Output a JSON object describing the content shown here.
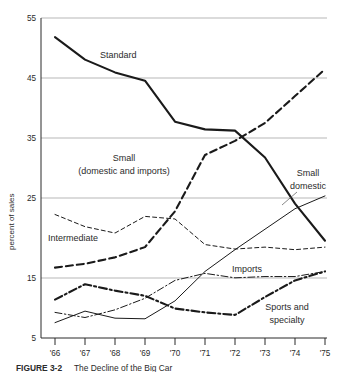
{
  "figure": {
    "caption_label": "FIGURE 3-2",
    "caption_text": "The Decline of the Big Car"
  },
  "chart_data": {
    "type": "line",
    "title": "",
    "xlabel": "",
    "ylabel": "percent of sales",
    "x": [
      "'66",
      "'67",
      "'68",
      "'69",
      "'70",
      "'71",
      "'72",
      "'73",
      "'74",
      "'75"
    ],
    "xlim": [
      0,
      9
    ],
    "ylim": [
      5,
      55
    ],
    "yticks": [
      55,
      45,
      35,
      25,
      15,
      5
    ],
    "gridlines": [
      55,
      45,
      35,
      25,
      15
    ],
    "grid": true,
    "legend": "inline-annotations",
    "series": [
      {
        "name": "Standard",
        "label": "Standard",
        "style": "solid-thick",
        "values": [
          52.0,
          48.5,
          46.5,
          45.2,
          38.8,
          37.6,
          37.4,
          33.2,
          26.0,
          20.2
        ]
      },
      {
        "name": "Small (domestic and imports)",
        "label": "Small\n(domestic and imports)",
        "style": "dashed-thick",
        "values": [
          16.0,
          16.6,
          17.6,
          19.2,
          24.8,
          33.6,
          35.8,
          38.6,
          42.8,
          47.0
        ]
      },
      {
        "name": "Intermediate",
        "label": "Intermediate",
        "style": "dashed-thin",
        "values": [
          24.3,
          22.4,
          21.4,
          24.0,
          23.6,
          19.6,
          18.9,
          19.2,
          18.8,
          19.2
        ]
      },
      {
        "name": "Small domestic",
        "label": "Small\ndomestic",
        "style": "solid-thin",
        "values": [
          7.4,
          9.2,
          8.1,
          8.0,
          10.8,
          15.4,
          18.8,
          22.0,
          25.2,
          27.2
        ]
      },
      {
        "name": "Imports",
        "label": "Imports",
        "style": "dashdot-thin",
        "values": [
          9.0,
          8.2,
          9.4,
          11.2,
          14.0,
          15.1,
          14.4,
          14.6,
          14.6,
          15.4
        ]
      },
      {
        "name": "Sports and specialty",
        "label": "Sports and\nspecialty",
        "style": "dashdot-thick",
        "values": [
          11.0,
          13.4,
          12.4,
          11.6,
          9.6,
          9.0,
          8.6,
          11.4,
          14.0,
          15.4
        ]
      }
    ],
    "annotations": [
      {
        "text": "Standard",
        "series": "Standard"
      },
      {
        "text": "Small",
        "series": "Small (domestic and imports)"
      },
      {
        "text": "(domestic and imports)",
        "series": "Small (domestic and imports)"
      },
      {
        "text": "Intermediate",
        "series": "Intermediate"
      },
      {
        "text": "Small",
        "series": "Small domestic"
      },
      {
        "text": "domestic",
        "series": "Small domestic"
      },
      {
        "text": "Imports",
        "series": "Imports"
      },
      {
        "text": "Sports and",
        "series": "Sports and specialty"
      },
      {
        "text": "specialty",
        "series": "Sports and specialty"
      }
    ]
  }
}
